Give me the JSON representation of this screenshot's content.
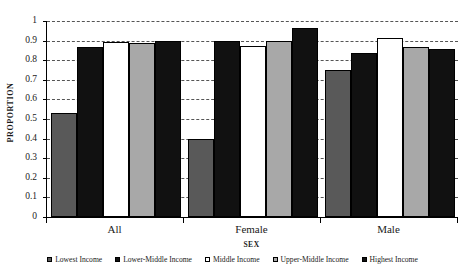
{
  "chart_data": {
    "type": "bar",
    "title": "",
    "xlabel": "SEX",
    "ylabel": "PROPORTION",
    "categories": [
      "All",
      "Female",
      "Male"
    ],
    "ylim": [
      0,
      1
    ],
    "yticks": [
      "1",
      "0.9",
      "0.8",
      "0.7",
      "0.6",
      "0.5",
      "0.4",
      "0.3",
      "0.2",
      "0.1",
      "0"
    ],
    "ytick_values": [
      1,
      0.9,
      0.8,
      0.7,
      0.6,
      0.5,
      0.4,
      0.3,
      0.2,
      0.1,
      0
    ],
    "grid": true,
    "legend_position": "bottom",
    "series": [
      {
        "name": "Lowest Income",
        "color": "#595959",
        "values": [
          0.53,
          0.4,
          0.75
        ]
      },
      {
        "name": "Lower-Middle Income",
        "color": "#111111",
        "values": [
          0.865,
          0.9,
          0.835
        ]
      },
      {
        "name": "Middle Income",
        "color": "#ffffff",
        "values": [
          0.895,
          0.875,
          0.915
        ]
      },
      {
        "name": "Upper-Middle Income",
        "color": "#a8a8a8",
        "values": [
          0.89,
          0.9,
          0.865
        ]
      },
      {
        "name": "Highest Income",
        "color": "#111111",
        "values": [
          0.9,
          0.965,
          0.855
        ]
      }
    ]
  }
}
